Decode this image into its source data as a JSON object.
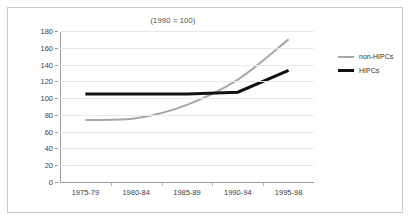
{
  "chart_data": {
    "type": "line",
    "title": "(1990 = 100)",
    "xlabel": "",
    "ylabel": "",
    "categories": [
      "1975-79",
      "1980-84",
      "1985-89",
      "1990-94",
      "1995-98"
    ],
    "series": [
      {
        "name": "non-HIPCs",
        "values": [
          74,
          76,
          92,
          122,
          170
        ],
        "color": "#a6a6a6",
        "width": 2,
        "smooth": true
      },
      {
        "name": "HIPCs",
        "values": [
          105,
          105,
          105,
          107,
          133
        ],
        "color": "#101010",
        "width": 3,
        "smooth": false
      }
    ],
    "ylim": [
      0,
      180
    ],
    "ytick_step": 20,
    "yticks": [
      180,
      160,
      140,
      120,
      100,
      80,
      60,
      40,
      20,
      0
    ],
    "grid": true,
    "legend_position": "right",
    "legend": [
      "non-HIPCs",
      "HIPCs"
    ]
  },
  "colors": {
    "border": "#c9c9c9",
    "grid": "#e9e9e9",
    "axis": "#9a9a9a",
    "text": "#3d3d3d",
    "title": "#4a4a4a",
    "non_hipcs": "#a6a6a6",
    "hipcs": "#101010"
  }
}
